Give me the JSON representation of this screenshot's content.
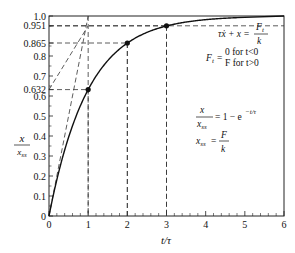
{
  "chart_data": {
    "type": "line",
    "title": "",
    "xlabel": "t/τ",
    "ylabel_num": "x",
    "ylabel_den": "x_ss",
    "xlim": [
      0,
      6
    ],
    "ylim": [
      0,
      1.0
    ],
    "x_ticks": [
      "0",
      "1",
      "2",
      "3",
      "4",
      "5",
      "6"
    ],
    "y_ticks": [
      {
        "v": 0,
        "label": "0"
      },
      {
        "v": 0.1,
        "label": "0.1"
      },
      {
        "v": 0.2,
        "label": "0.2"
      },
      {
        "v": 0.3,
        "label": "0.3"
      },
      {
        "v": 0.4,
        "label": "0.4"
      },
      {
        "v": 0.5,
        "label": "0.5"
      },
      {
        "v": 0.6,
        "label": "0.6"
      },
      {
        "v": 0.632,
        "label": "0.632"
      },
      {
        "v": 0.7,
        "label": "0.7"
      },
      {
        "v": 0.8,
        "label": "0.8"
      },
      {
        "v": 0.865,
        "label": "0.865"
      },
      {
        "v": 0.951,
        "label": "0.951"
      },
      {
        "v": 1.0,
        "label": "1.0"
      }
    ],
    "grid": false,
    "series": [
      {
        "name": "x/x_ss = 1 - e^(-t/τ)",
        "function": "1-exp(-t)",
        "x_range": [
          0,
          4.8
        ]
      }
    ],
    "marked_points": [
      {
        "x": 1,
        "y": 0.632
      },
      {
        "x": 2,
        "y": 0.865
      },
      {
        "x": 3,
        "y": 0.951
      }
    ],
    "tangent_lines": [
      {
        "from": [
          0,
          0
        ],
        "to": [
          1,
          1
        ]
      },
      {
        "from": [
          0,
          0.632
        ],
        "to": [
          1,
          0.951
        ]
      }
    ],
    "annotations": {
      "eq1_lhs": "τẋ + x =",
      "eq1_num": "F",
      "eq1_num_sub": "t",
      "eq1_den": "k",
      "eq2_lhs": "F",
      "eq2_lhs_sub": "t",
      "eq2_case1": "0 for t<0",
      "eq2_case2": "F for t>0",
      "eq3_num": "x",
      "eq3_den": "x",
      "eq3_den_sub": "ss",
      "eq3_rhs": "= 1 − e",
      "eq3_exp": "−t/τ",
      "eq4_lhs": "x",
      "eq4_lhs_sub": "ss",
      "eq4_num": "F",
      "eq4_den": "k"
    }
  }
}
